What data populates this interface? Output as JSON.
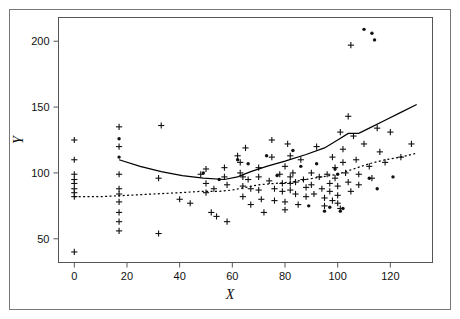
{
  "figure": {
    "background_color": "#ffffff",
    "outer_border_color": "#777777",
    "plot_border_color": "#555555",
    "marker_color": "#111111",
    "solid_line_color": "#000000",
    "dotted_line_color": "#000000"
  },
  "chart_data": {
    "type": "scatter",
    "title": "",
    "subtitle": "",
    "xlabel": "X",
    "ylabel": "Y",
    "xlim": [
      -6,
      136
    ],
    "ylim": [
      32,
      218
    ],
    "xticks": [
      0,
      20,
      40,
      60,
      80,
      100,
      120
    ],
    "yticks": [
      50,
      100,
      150,
      200
    ],
    "xtick_labels": [
      "0",
      "20",
      "40",
      "60",
      "80",
      "100",
      "120"
    ],
    "ytick_labels": [
      "50",
      "100",
      "150",
      "200"
    ],
    "grid": false,
    "legend": null,
    "legend_position": "none",
    "annotations": [],
    "series": [
      {
        "name": "plus-markers",
        "marker": "plus",
        "points": [
          [
            0,
            125
          ],
          [
            0,
            110
          ],
          [
            0,
            99
          ],
          [
            0,
            95
          ],
          [
            0,
            92
          ],
          [
            0,
            88
          ],
          [
            0,
            85
          ],
          [
            0,
            82
          ],
          [
            0,
            40
          ],
          [
            17,
            135
          ],
          [
            17,
            120
          ],
          [
            17,
            99
          ],
          [
            17,
            88
          ],
          [
            17,
            84
          ],
          [
            17,
            78
          ],
          [
            17,
            70
          ],
          [
            17,
            63
          ],
          [
            17,
            56
          ],
          [
            32,
            96
          ],
          [
            32,
            54
          ],
          [
            33,
            136
          ],
          [
            40,
            80
          ],
          [
            44,
            77
          ],
          [
            48,
            99
          ],
          [
            50,
            103
          ],
          [
            50,
            92
          ],
          [
            50,
            85
          ],
          [
            52,
            70
          ],
          [
            53,
            88
          ],
          [
            54,
            67
          ],
          [
            57,
            104
          ],
          [
            57,
            97
          ],
          [
            58,
            91
          ],
          [
            58,
            63
          ],
          [
            62,
            113
          ],
          [
            63,
            108
          ],
          [
            63,
            100
          ],
          [
            64,
            97
          ],
          [
            64,
            90
          ],
          [
            64,
            82
          ],
          [
            65,
            119
          ],
          [
            66,
            95
          ],
          [
            67,
            88
          ],
          [
            67,
            76
          ],
          [
            70,
            104
          ],
          [
            70,
            97
          ],
          [
            70,
            87
          ],
          [
            71,
            80
          ],
          [
            72,
            70
          ],
          [
            74,
            94
          ],
          [
            75,
            125
          ],
          [
            75,
            112
          ],
          [
            76,
            88
          ],
          [
            76,
            79
          ],
          [
            78,
            99
          ],
          [
            79,
            92
          ],
          [
            79,
            86
          ],
          [
            80,
            105
          ],
          [
            80,
            78
          ],
          [
            80,
            72
          ],
          [
            81,
            122
          ],
          [
            82,
            113
          ],
          [
            82,
            97
          ],
          [
            82,
            92
          ],
          [
            82,
            87
          ],
          [
            83,
            100
          ],
          [
            84,
            93
          ],
          [
            84,
            84
          ],
          [
            85,
            76
          ],
          [
            86,
            110
          ],
          [
            87,
            95
          ],
          [
            88,
            89
          ],
          [
            88,
            82
          ],
          [
            90,
            100
          ],
          [
            90,
            91
          ],
          [
            91,
            84
          ],
          [
            92,
            120
          ],
          [
            93,
            97
          ],
          [
            94,
            88
          ],
          [
            95,
            81
          ],
          [
            95,
            75
          ],
          [
            96,
            99
          ],
          [
            97,
            92
          ],
          [
            97,
            86
          ],
          [
            98,
            79
          ],
          [
            98,
            112
          ],
          [
            99,
            104
          ],
          [
            99,
            96
          ],
          [
            100,
            90
          ],
          [
            100,
            83
          ],
          [
            100,
            77
          ],
          [
            101,
            73
          ],
          [
            101,
            131
          ],
          [
            102,
            118
          ],
          [
            102,
            108
          ],
          [
            103,
            100
          ],
          [
            104,
            143
          ],
          [
            104,
            93
          ],
          [
            105,
            197
          ],
          [
            105,
            86
          ],
          [
            106,
            128
          ],
          [
            107,
            110
          ],
          [
            108,
            99
          ],
          [
            108,
            91
          ],
          [
            110,
            122
          ],
          [
            112,
            105
          ],
          [
            113,
            96
          ],
          [
            115,
            134
          ],
          [
            116,
            116
          ],
          [
            118,
            108
          ],
          [
            120,
            131
          ],
          [
            124,
            112
          ],
          [
            128,
            122
          ]
        ]
      },
      {
        "name": "dot-markers",
        "marker": "dot",
        "points": [
          [
            17,
            126
          ],
          [
            17,
            112
          ],
          [
            49,
            100
          ],
          [
            55,
            95
          ],
          [
            62,
            110
          ],
          [
            66,
            107
          ],
          [
            73,
            113
          ],
          [
            77,
            98
          ],
          [
            83,
            117
          ],
          [
            86,
            105
          ],
          [
            89,
            75
          ],
          [
            92,
            107
          ],
          [
            95,
            71
          ],
          [
            97,
            74
          ],
          [
            99,
            103
          ],
          [
            100,
            99
          ],
          [
            101,
            71
          ],
          [
            102,
            73
          ],
          [
            110,
            209
          ],
          [
            112,
            96
          ],
          [
            113,
            206
          ],
          [
            114,
            201
          ],
          [
            115,
            88
          ],
          [
            121,
            97
          ]
        ]
      },
      {
        "name": "solid-smooth-curve",
        "style": "solid",
        "points": [
          [
            17,
            110
          ],
          [
            25,
            105
          ],
          [
            33,
            101
          ],
          [
            41,
            98
          ],
          [
            49,
            96
          ],
          [
            57,
            95
          ],
          [
            62,
            97
          ],
          [
            67,
            101
          ],
          [
            73,
            105
          ],
          [
            80,
            109
          ],
          [
            88,
            114
          ],
          [
            95,
            119
          ],
          [
            100,
            125
          ],
          [
            104,
            130
          ],
          [
            108,
            130
          ],
          [
            112,
            134
          ],
          [
            118,
            140
          ],
          [
            124,
            146
          ],
          [
            130,
            152
          ]
        ]
      },
      {
        "name": "dotted-smooth-curve",
        "style": "dotted",
        "points": [
          [
            0,
            82
          ],
          [
            10,
            82
          ],
          [
            20,
            83
          ],
          [
            30,
            84
          ],
          [
            40,
            85
          ],
          [
            48,
            86
          ],
          [
            55,
            86
          ],
          [
            60,
            87
          ],
          [
            65,
            89
          ],
          [
            70,
            91
          ],
          [
            76,
            92
          ],
          [
            82,
            93
          ],
          [
            88,
            95
          ],
          [
            94,
            97
          ],
          [
            100,
            99
          ],
          [
            106,
            103
          ],
          [
            112,
            107
          ],
          [
            118,
            110
          ],
          [
            124,
            112
          ],
          [
            130,
            115
          ]
        ]
      }
    ]
  }
}
